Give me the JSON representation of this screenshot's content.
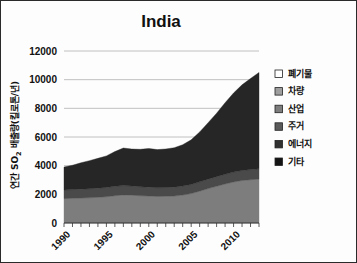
{
  "chart_data": {
    "type": "area",
    "stacked": true,
    "title": "India",
    "xlabel": "",
    "ylabel": "연간 SO₂ 배출량(킬로톤/년)",
    "ylabel_parts": {
      "prefix": "연간 SO",
      "sub": "2",
      "suffix": " 배출량(킬로톤/년)"
    },
    "xlim": [
      1990,
      2013
    ],
    "ylim": [
      0,
      12000
    ],
    "ytick_values": [
      0,
      2000,
      4000,
      6000,
      8000,
      10000,
      12000
    ],
    "ytick_labels": [
      "0",
      "2000",
      "4000",
      "6000",
      "8000",
      "10000",
      "12000"
    ],
    "xtick_values": [
      1990,
      1995,
      2000,
      2005,
      2010
    ],
    "xtick_labels": [
      "1990",
      "1995",
      "2000",
      "2005",
      "2010"
    ],
    "xtick_minor_step": 1,
    "grid": "horizontal",
    "legend_position": "right",
    "x": [
      1990,
      1991,
      1992,
      1993,
      1994,
      1995,
      1996,
      1997,
      1998,
      1999,
      2000,
      2001,
      2002,
      2003,
      2004,
      2005,
      2006,
      2007,
      2008,
      2009,
      2010,
      2011,
      2012,
      2013
    ],
    "series": [
      {
        "name": "에너지",
        "color": "#7d7d7d",
        "values": [
          1700,
          1720,
          1740,
          1760,
          1790,
          1830,
          1900,
          1960,
          1940,
          1900,
          1880,
          1850,
          1860,
          1880,
          1950,
          2050,
          2220,
          2400,
          2560,
          2720,
          2860,
          2960,
          3020,
          3060
        ]
      },
      {
        "name": "산업",
        "color": "#4a4a4a",
        "values": [
          600,
          610,
          620,
          630,
          640,
          650,
          660,
          650,
          640,
          630,
          620,
          610,
          615,
          620,
          630,
          640,
          650,
          660,
          670,
          680,
          690,
          700,
          710,
          720
        ]
      },
      {
        "name": "주거",
        "color": "#262626",
        "values": [
          1600,
          1700,
          1840,
          1960,
          2080,
          2200,
          2420,
          2620,
          2580,
          2610,
          2700,
          2660,
          2690,
          2750,
          2880,
          3110,
          3480,
          3940,
          4430,
          4990,
          5520,
          5980,
          6350,
          6720
        ]
      },
      {
        "name": "차량",
        "color": "#9e9e9e",
        "values": [
          0,
          0,
          0,
          0,
          0,
          0,
          0,
          0,
          0,
          0,
          0,
          0,
          0,
          0,
          0,
          0,
          0,
          0,
          0,
          0,
          0,
          0,
          0,
          0
        ]
      },
      {
        "name": "폐기물",
        "color": "#ffffff",
        "values": [
          0,
          0,
          0,
          0,
          0,
          0,
          0,
          0,
          0,
          0,
          0,
          0,
          0,
          0,
          0,
          0,
          0,
          0,
          0,
          0,
          0,
          0,
          0,
          0
        ]
      },
      {
        "name": "기타",
        "color": "#111111",
        "values": [
          0,
          0,
          0,
          0,
          0,
          0,
          0,
          0,
          0,
          0,
          0,
          0,
          0,
          0,
          0,
          0,
          0,
          0,
          0,
          0,
          0,
          0,
          0,
          0
        ]
      }
    ],
    "totals": [
      3900,
      4030,
      4200,
      4350,
      4510,
      4680,
      4980,
      5230,
      5160,
      5140,
      5200,
      5120,
      5165,
      5250,
      5460,
      5800,
      6350,
      7000,
      7660,
      8390,
      9070,
      9640,
      10080,
      10500
    ]
  },
  "legend": {
    "items": [
      {
        "label": "폐기물",
        "color": "#ffffff"
      },
      {
        "label": "차량",
        "color": "#9e9e9e"
      },
      {
        "label": "산업",
        "color": "#7d7d7d"
      },
      {
        "label": "주거",
        "color": "#5a5a5a"
      },
      {
        "label": "에너지",
        "color": "#303030"
      },
      {
        "label": "기타",
        "color": "#141414"
      }
    ]
  }
}
